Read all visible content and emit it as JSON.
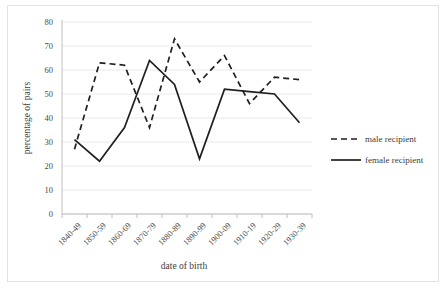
{
  "chart_data": {
    "type": "line",
    "title": "",
    "xlabel": "date of birth",
    "ylabel": "percentage of pairs",
    "categories": [
      "1840-49",
      "1850-59",
      "1860-69",
      "1870-79",
      "1880-89",
      "1890-99",
      "1900-09",
      "1910-19",
      "1920-29",
      "1930-39"
    ],
    "series": [
      {
        "name": "male recipient",
        "style": "dashed",
        "values": [
          27,
          63,
          62,
          36,
          73,
          55,
          66,
          46,
          57,
          56
        ]
      },
      {
        "name": "female recipient",
        "style": "solid",
        "values": [
          31,
          22,
          36,
          64,
          54,
          23,
          52,
          51,
          50,
          38
        ]
      }
    ],
    "ylim": [
      0,
      80
    ],
    "ytick_labels": [
      "0",
      "10",
      "20",
      "30",
      "40",
      "50",
      "60",
      "70",
      "80"
    ],
    "ytick_values": [
      0,
      10,
      20,
      30,
      40,
      50,
      60,
      70,
      80
    ],
    "grid": true,
    "legend_position": "right",
    "colors": {
      "series_line": "#1f1f1f",
      "gridline": "#e3e3e3",
      "axis": "#b9b9b9",
      "text": "#4a4a4a",
      "frame": "#e2e2e2",
      "background": "#ffffff"
    }
  },
  "legend": {
    "entries": [
      {
        "label": "male recipient"
      },
      {
        "label": "female recipient"
      }
    ]
  }
}
